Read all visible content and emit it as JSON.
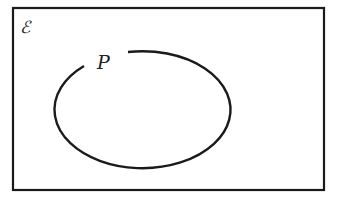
{
  "diagram": {
    "type": "venn",
    "universal_set": {
      "label": "ℰ"
    },
    "sets": [
      {
        "label": "P"
      }
    ],
    "colors": {
      "stroke": "#1a1a1a",
      "background": "#ffffff"
    }
  }
}
